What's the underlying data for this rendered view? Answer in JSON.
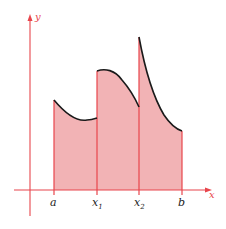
{
  "figure": {
    "colors": {
      "axis": "#e8454c",
      "fill": "#f2b3b5",
      "curve": "#1a1a1a",
      "label_axis": "#e8454c",
      "label_tick": "#222222"
    },
    "axes": {
      "x_label": "x",
      "y_label": "y"
    },
    "ticks": [
      {
        "id": "a",
        "label": "a",
        "sub": ""
      },
      {
        "id": "x1",
        "label": "x",
        "sub": "1"
      },
      {
        "id": "x2",
        "label": "x",
        "sub": "2"
      },
      {
        "id": "b",
        "label": "b",
        "sub": ""
      }
    ],
    "pieces": [
      {
        "from": "a",
        "to": "x1",
        "shape": "concave-up dip"
      },
      {
        "from": "x1",
        "to": "x2",
        "shape": "concave-down decreasing"
      },
      {
        "from": "x2",
        "to": "b",
        "shape": "convex decreasing"
      }
    ]
  }
}
